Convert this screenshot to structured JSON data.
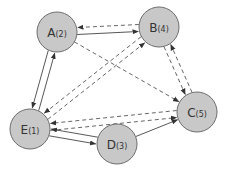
{
  "diagram": {
    "type": "directed-graph",
    "colors": {
      "node_fill": "#c8c8c8",
      "node_stroke": "#6e6e6e",
      "edge": "#444444",
      "background": "#ffffff"
    },
    "nodes": [
      {
        "id": "A",
        "label": "A",
        "sub": "(2)"
      },
      {
        "id": "B",
        "label": "B",
        "sub": "(4)"
      },
      {
        "id": "C",
        "label": "C",
        "sub": "(5)"
      },
      {
        "id": "D",
        "label": "D",
        "sub": "(3)"
      },
      {
        "id": "E",
        "label": "E",
        "sub": "(1)"
      }
    ],
    "edges": [
      {
        "from": "A",
        "to": "B",
        "style": "solid"
      },
      {
        "from": "B",
        "to": "A",
        "style": "dashed"
      },
      {
        "from": "A",
        "to": "E",
        "style": "solid"
      },
      {
        "from": "E",
        "to": "A",
        "style": "solid"
      },
      {
        "from": "A",
        "to": "C",
        "style": "dashed"
      },
      {
        "from": "B",
        "to": "E",
        "style": "dashed"
      },
      {
        "from": "E",
        "to": "B",
        "style": "dashed"
      },
      {
        "from": "B",
        "to": "C",
        "style": "dashed"
      },
      {
        "from": "C",
        "to": "B",
        "style": "dashed"
      },
      {
        "from": "C",
        "to": "E",
        "style": "dashed"
      },
      {
        "from": "E",
        "to": "C",
        "style": "dashed"
      },
      {
        "from": "E",
        "to": "D",
        "style": "solid"
      },
      {
        "from": "D",
        "to": "E",
        "style": "solid"
      },
      {
        "from": "D",
        "to": "C",
        "style": "solid"
      }
    ]
  }
}
